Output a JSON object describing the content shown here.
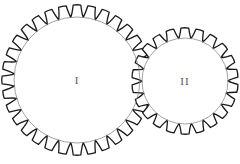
{
  "figure": {
    "title": "",
    "background_color": "#ffffff",
    "width": 240,
    "height": 164,
    "outline_color": "#1a1a1a",
    "root_circle_color": "#8a8a8a",
    "label_color": "#555555"
  },
  "chart_data": {
    "type": "diagram",
    "subtype": "gear-train",
    "title": "",
    "xlabel": "",
    "ylabel": "",
    "grid": false,
    "legend": false,
    "annotations": [
      "I",
      "II"
    ],
    "series": [
      {
        "name": "I",
        "label": "I",
        "role": "driver-gear",
        "teeth": 32,
        "center_x": 77,
        "center_y": 80,
        "outer_radius": 75,
        "root_radius": 63,
        "inner_circle_radius": 63,
        "tooth_depth": 12,
        "phase_deg": 0
      },
      {
        "name": "II",
        "label": "II",
        "role": "driven-gear",
        "teeth": 22,
        "center_x": 185,
        "center_y": 81,
        "outer_radius": 53,
        "root_radius": 43,
        "inner_circle_radius": 43,
        "tooth_depth": 10,
        "phase_deg": 8
      }
    ],
    "mesh": {
      "center_distance": 108,
      "mesh_point_x": 131,
      "mesh_point_y": 80
    }
  },
  "labels": {
    "gear_one": "I",
    "gear_two": "II"
  }
}
